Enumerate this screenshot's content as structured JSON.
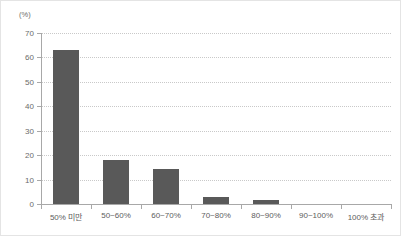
{
  "chart_data": {
    "type": "bar",
    "title": "",
    "subtitle": "",
    "unit_label": "(%)",
    "xlabel": "",
    "ylabel": "",
    "ylim": [
      0,
      70
    ],
    "y_ticks": [
      0,
      10,
      20,
      30,
      40,
      50,
      60,
      70
    ],
    "y_tick_labels": [
      "0",
      "10",
      "20",
      "30",
      "40",
      "50",
      "60",
      "70"
    ],
    "grid": "horizontal-dotted",
    "legend": "none",
    "categories": [
      "50% 미만",
      "50~60%",
      "60~70%",
      "70~80%",
      "80~90%",
      "90~100%",
      "100% 초과"
    ],
    "values": [
      63.0,
      18.0,
      14.3,
      3.0,
      1.5,
      0.0,
      0.0
    ],
    "series": [
      {
        "name": "",
        "values": [
          63.0,
          18.0,
          14.3,
          3.0,
          1.5,
          0.0,
          0.0
        ]
      }
    ],
    "colors": {
      "bar": "#595959",
      "axis": "#a8a8a8",
      "gridline": "#c9c9c9",
      "tick_text": "#5d5d5d",
      "unit_text": "#6b6b6b",
      "border": "#e4e4e4",
      "background": "#ffffff"
    }
  }
}
